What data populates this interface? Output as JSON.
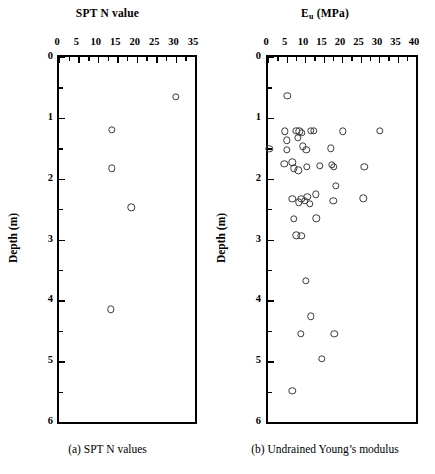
{
  "figure": {
    "panels": [
      {
        "id": "a",
        "title_main": "SPT N value",
        "title_sub": "",
        "caption": "(a)  SPT N values",
        "xlabel": "SPT N value",
        "ylabel": "Depth (m)",
        "xticks": [
          0,
          5,
          10,
          15,
          20,
          25,
          30,
          35
        ],
        "xtick_labels": [
          "0",
          "5",
          "10",
          "15",
          "20",
          "25",
          "30",
          "35"
        ],
        "yticks": [
          0,
          1,
          2,
          3,
          4,
          5,
          6
        ],
        "ytick_labels": [
          "0",
          "1",
          "2",
          "3",
          "4",
          "5",
          "6"
        ],
        "yminor": [
          0.5,
          1.5,
          2.5,
          3.5,
          4.5,
          5.5
        ],
        "xminor": [
          2.5,
          7.5,
          12.5,
          17.5,
          22.5,
          27.5,
          32.5
        ]
      },
      {
        "id": "b",
        "title_main": "E",
        "title_sub": "u",
        "title_tail": " (MPa)",
        "caption": "(b) Undrained Young’s modulus",
        "xlabel": "Eu (MPa)",
        "ylabel": "Depth (m)",
        "xticks": [
          0,
          5,
          10,
          15,
          20,
          25,
          30,
          35,
          40
        ],
        "xtick_labels": [
          "0",
          "5",
          "10",
          "15",
          "20",
          "25",
          "30",
          "35",
          "40"
        ],
        "yticks": [
          0,
          1,
          2,
          3,
          4,
          5,
          6
        ],
        "ytick_labels": [
          "0",
          "1",
          "2",
          "3",
          "4",
          "5",
          "6"
        ],
        "yminor": [
          0.5,
          1.5,
          2.5,
          3.5,
          4.5,
          5.5
        ],
        "xminor": [
          2.5,
          7.5,
          12.5,
          17.5,
          22.5,
          27.5,
          32.5,
          37.5
        ]
      }
    ]
  },
  "chart_data": [
    {
      "type": "scatter",
      "title": "SPT N value",
      "xlabel": "SPT N value",
      "ylabel": "Depth (m)",
      "xlim": [
        0,
        35
      ],
      "ylim": [
        0,
        6
      ],
      "y_inverted": true,
      "grid": false,
      "legend": null,
      "marker": "open-circle",
      "points": [
        {
          "x": 30.0,
          "y": 0.65
        },
        {
          "x": 13.6,
          "y": 1.2
        },
        {
          "x": 13.6,
          "y": 1.83
        },
        {
          "x": 18.6,
          "y": 2.47
        },
        {
          "x": 13.3,
          "y": 4.15
        }
      ]
    },
    {
      "type": "scatter",
      "title": "Eu (MPa)",
      "xlabel": "Eu (MPa)",
      "ylabel": "Depth (m)",
      "xlim": [
        0,
        40
      ],
      "ylim": [
        0,
        6
      ],
      "y_inverted": true,
      "grid": false,
      "legend": null,
      "marker": "open-circle",
      "points": [
        {
          "x": 5.2,
          "y": 0.64
        },
        {
          "x": 4.6,
          "y": 1.22
        },
        {
          "x": 7.6,
          "y": 1.21
        },
        {
          "x": 8.5,
          "y": 1.22
        },
        {
          "x": 9.1,
          "y": 1.25
        },
        {
          "x": 11.6,
          "y": 1.21
        },
        {
          "x": 12.4,
          "y": 1.21
        },
        {
          "x": 20.2,
          "y": 1.22
        },
        {
          "x": 30.2,
          "y": 1.21
        },
        {
          "x": 5.0,
          "y": 1.37
        },
        {
          "x": 8.1,
          "y": 1.33
        },
        {
          "x": 0.4,
          "y": 1.51
        },
        {
          "x": 5.0,
          "y": 1.53
        },
        {
          "x": 9.4,
          "y": 1.47
        },
        {
          "x": 10.4,
          "y": 1.53
        },
        {
          "x": 17.0,
          "y": 1.5
        },
        {
          "x": 4.4,
          "y": 1.76
        },
        {
          "x": 6.6,
          "y": 1.73
        },
        {
          "x": 6.9,
          "y": 1.83
        },
        {
          "x": 8.2,
          "y": 1.86
        },
        {
          "x": 10.5,
          "y": 1.8
        },
        {
          "x": 14.0,
          "y": 1.79
        },
        {
          "x": 17.3,
          "y": 1.77
        },
        {
          "x": 17.8,
          "y": 1.8
        },
        {
          "x": 26.0,
          "y": 1.81
        },
        {
          "x": 18.4,
          "y": 2.12
        },
        {
          "x": 6.6,
          "y": 2.33
        },
        {
          "x": 8.3,
          "y": 2.39
        },
        {
          "x": 9.0,
          "y": 2.33
        },
        {
          "x": 9.9,
          "y": 2.36
        },
        {
          "x": 10.6,
          "y": 2.3
        },
        {
          "x": 11.3,
          "y": 2.41
        },
        {
          "x": 13.0,
          "y": 2.26
        },
        {
          "x": 17.6,
          "y": 2.36
        },
        {
          "x": 25.8,
          "y": 2.32
        },
        {
          "x": 6.9,
          "y": 2.66
        },
        {
          "x": 13.1,
          "y": 2.65
        },
        {
          "x": 7.6,
          "y": 2.93
        },
        {
          "x": 9.0,
          "y": 2.94
        },
        {
          "x": 10.2,
          "y": 3.68
        },
        {
          "x": 11.5,
          "y": 4.26
        },
        {
          "x": 8.8,
          "y": 4.55
        },
        {
          "x": 17.9,
          "y": 4.55
        },
        {
          "x": 14.6,
          "y": 4.96
        },
        {
          "x": 6.6,
          "y": 5.49
        }
      ]
    }
  ]
}
